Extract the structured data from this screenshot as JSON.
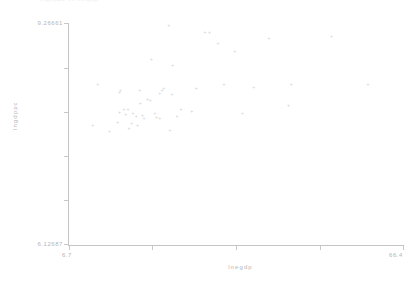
{
  "header": {
    "cropped_text": "lngdppc  vs  lnegdp"
  },
  "axes": {
    "x_title": "lnegdp",
    "y_title": "lngdppc",
    "x_min_label": "6.7",
    "x_max_label": "66.4",
    "y_min_label": "6.12687",
    "y_max_label": "9.26661"
  },
  "chart_data": {
    "type": "scatter",
    "title": "",
    "xlabel": "lnegdp",
    "ylabel": "lngdppc",
    "xlim": [
      6.7,
      66.4
    ],
    "ylim": [
      6.12687,
      9.26661
    ],
    "grid": false,
    "legend": null,
    "x_ticks": [
      6.7,
      66.4
    ],
    "y_ticks": [
      6.12687,
      9.26661
    ],
    "marker_glyph": "+",
    "marker_color": "#d2d2d2",
    "points": [
      {
        "x": 24.6,
        "y": 9.25
      },
      {
        "x": 31.1,
        "y": 9.15
      },
      {
        "x": 31.9,
        "y": 9.15
      },
      {
        "x": 42.5,
        "y": 9.07
      },
      {
        "x": 53.7,
        "y": 9.09
      },
      {
        "x": 33.4,
        "y": 8.99
      },
      {
        "x": 36.4,
        "y": 8.88
      },
      {
        "x": 21.5,
        "y": 8.77
      },
      {
        "x": 25.3,
        "y": 8.68
      },
      {
        "x": 11.9,
        "y": 8.41
      },
      {
        "x": 34.5,
        "y": 8.41
      },
      {
        "x": 46.5,
        "y": 8.41
      },
      {
        "x": 60.2,
        "y": 8.41
      },
      {
        "x": 39.8,
        "y": 8.37
      },
      {
        "x": 23.7,
        "y": 8.36
      },
      {
        "x": 29.5,
        "y": 8.35
      },
      {
        "x": 16.0,
        "y": 8.33
      },
      {
        "x": 19.4,
        "y": 8.33
      },
      {
        "x": 23.4,
        "y": 8.32
      },
      {
        "x": 15.8,
        "y": 8.3
      },
      {
        "x": 23.0,
        "y": 8.28
      },
      {
        "x": 25.2,
        "y": 8.27
      },
      {
        "x": 20.8,
        "y": 8.19
      },
      {
        "x": 21.3,
        "y": 8.18
      },
      {
        "x": 19.5,
        "y": 8.14
      },
      {
        "x": 46.0,
        "y": 8.11
      },
      {
        "x": 16.6,
        "y": 8.06
      },
      {
        "x": 17.3,
        "y": 8.05
      },
      {
        "x": 26.8,
        "y": 8.05
      },
      {
        "x": 28.7,
        "y": 8.03
      },
      {
        "x": 15.8,
        "y": 8.01
      },
      {
        "x": 18.2,
        "y": 8.0
      },
      {
        "x": 22.1,
        "y": 8.0
      },
      {
        "x": 37.8,
        "y": 8.0
      },
      {
        "x": 16.9,
        "y": 7.98
      },
      {
        "x": 19.9,
        "y": 7.97
      },
      {
        "x": 26.1,
        "y": 7.96
      },
      {
        "x": 18.8,
        "y": 7.95
      },
      {
        "x": 22.4,
        "y": 7.94
      },
      {
        "x": 20.2,
        "y": 7.92
      },
      {
        "x": 23.0,
        "y": 7.92
      },
      {
        "x": 15.5,
        "y": 7.87
      },
      {
        "x": 18.0,
        "y": 7.85
      },
      {
        "x": 19.0,
        "y": 7.83
      },
      {
        "x": 11.0,
        "y": 7.82
      },
      {
        "x": 17.5,
        "y": 7.79
      },
      {
        "x": 24.8,
        "y": 7.76
      },
      {
        "x": 14.0,
        "y": 7.74
      }
    ]
  }
}
